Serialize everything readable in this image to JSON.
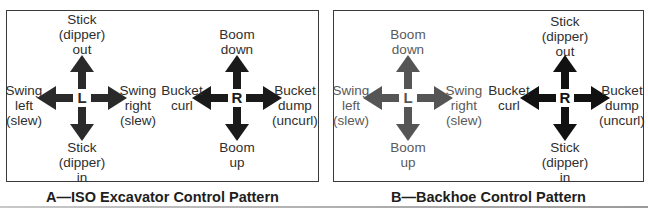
{
  "panels": {
    "a": {
      "caption": "A—ISO Excavator Control Pattern",
      "left_stick": {
        "letter": "L",
        "color": "#2a2a2a",
        "up": [
          "Stick",
          "(dipper)",
          "out"
        ],
        "down": [
          "Stick",
          "(dipper)",
          "in"
        ],
        "left": [
          "Swing",
          "left",
          "(slew)"
        ],
        "right": [
          "Swing",
          "right",
          "(slew)"
        ]
      },
      "right_stick": {
        "letter": "R",
        "color": "#1a1a1a",
        "up": [
          "Boom",
          "down"
        ],
        "down": [
          "Boom",
          "up"
        ],
        "left": [
          "Bucket",
          "curl"
        ],
        "right": [
          "Bucket",
          "dump",
          "(uncurl)"
        ]
      }
    },
    "b": {
      "caption": "B—Backhoe Control Pattern",
      "left_stick": {
        "letter": "L",
        "color": "#555555",
        "up": [
          "Boom",
          "down"
        ],
        "down": [
          "Boom",
          "up"
        ],
        "left": [
          "Swing",
          "left",
          "(slew)"
        ],
        "right": [
          "Swing",
          "right",
          "(slew)"
        ]
      },
      "right_stick": {
        "letter": "R",
        "color": "#111111",
        "up": [
          "Stick",
          "(dipper)",
          "out"
        ],
        "down": [
          "Stick",
          "(dipper)",
          "in"
        ],
        "left": [
          "Bucket",
          "curl"
        ],
        "right": [
          "Bucket",
          "dump",
          "(uncurl)"
        ]
      }
    }
  }
}
